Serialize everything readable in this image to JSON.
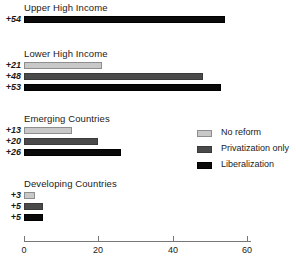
{
  "chart_data": {
    "type": "bar",
    "orientation": "horizontal",
    "title": "",
    "xlabel": "",
    "ylabel": "",
    "xlim": [
      0,
      63
    ],
    "xticks": [
      0,
      20,
      40,
      60
    ],
    "xtick_labels": [
      "0",
      "20",
      "40",
      "60"
    ],
    "grid": false,
    "legend_position": "right",
    "series": [
      {
        "name": "No reform",
        "color": "#c8c8c8"
      },
      {
        "name": "Privatization only",
        "color": "#4a4a4a"
      },
      {
        "name": "Liberalization",
        "color": "#0a0a0a"
      }
    ],
    "categories": [
      "Upper High Income",
      "Lower High Income",
      "Emerging Countries",
      "Developing Countries"
    ],
    "groups": [
      {
        "label": "Upper High Income",
        "bars": [
          {
            "series": "Liberalization",
            "series_index": 2,
            "value": 54,
            "data_label": "+54"
          }
        ]
      },
      {
        "label": "Lower High Income",
        "bars": [
          {
            "series": "No reform",
            "series_index": 0,
            "value": 21,
            "data_label": "+21"
          },
          {
            "series": "Privatization only",
            "series_index": 1,
            "value": 48,
            "data_label": "+48"
          },
          {
            "series": "Liberalization",
            "series_index": 2,
            "value": 53,
            "data_label": "+53"
          }
        ]
      },
      {
        "label": "Emerging Countries",
        "bars": [
          {
            "series": "No reform",
            "series_index": 0,
            "value": 13,
            "data_label": "+13"
          },
          {
            "series": "Privatization only",
            "series_index": 1,
            "value": 20,
            "data_label": "+20"
          },
          {
            "series": "Liberalization",
            "series_index": 2,
            "value": 26,
            "data_label": "+26"
          }
        ]
      },
      {
        "label": "Developing Countries",
        "bars": [
          {
            "series": "No reform",
            "series_index": 0,
            "value": 3,
            "data_label": "+3"
          },
          {
            "series": "Privatization only",
            "series_index": 1,
            "value": 5,
            "data_label": "+5"
          },
          {
            "series": "Liberalization",
            "series_index": 2,
            "value": 5,
            "data_label": "+5"
          }
        ]
      }
    ]
  },
  "legend": {
    "items": [
      {
        "label": "No reform"
      },
      {
        "label": "Privatization only"
      },
      {
        "label": "Liberalization"
      }
    ]
  },
  "axis": {
    "ticks": [
      {
        "label": "0",
        "value": 0
      },
      {
        "label": "20",
        "value": 20
      },
      {
        "label": "40",
        "value": 40
      },
      {
        "label": "60",
        "value": 60
      }
    ]
  }
}
